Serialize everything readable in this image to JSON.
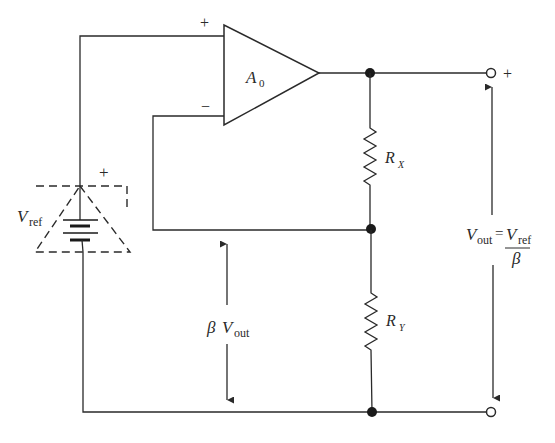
{
  "diagram": {
    "type": "voltage reference amplifier circuit",
    "components": {
      "opamp": {
        "label": "A",
        "label_sub": "0",
        "plus_sign": "+",
        "minus_sign": "−"
      },
      "reference": {
        "label": "V",
        "label_sub": "ref",
        "plus_sign": "+"
      },
      "resistor_x": {
        "label": "R",
        "label_sub": "X"
      },
      "resistor_y": {
        "label": "R",
        "label_sub": "Y"
      },
      "output_terminal": {
        "plus_sign": "+"
      }
    },
    "annotations": {
      "feedback_voltage": {
        "beta": "β",
        "v": "V",
        "sub": "out"
      },
      "output_equation": {
        "lhs_v": "V",
        "lhs_sub": "out",
        "equals": "=",
        "num_v": "V",
        "num_sub": "ref",
        "denominator": "β"
      }
    },
    "colors": {
      "line": "#2a2a2a",
      "background": "#ffffff"
    }
  }
}
